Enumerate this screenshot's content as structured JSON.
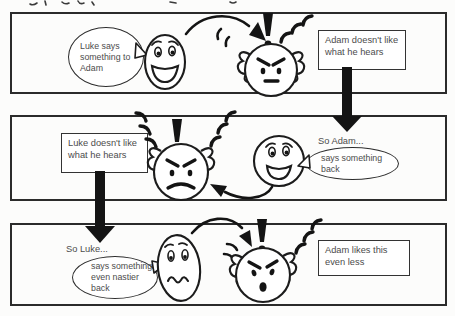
{
  "panel1": {
    "bubble": "Luke says something to Adam",
    "box": "Adam doesn't like what he hears"
  },
  "panel2": {
    "box": "Luke doesn't like what he hears",
    "caption": "So Adam...",
    "bubble": "says something back"
  },
  "panel3": {
    "caption": "So Luke...",
    "bubble": "says something even nastier back",
    "box": "Adam likes this even less"
  },
  "icons": {
    "happy_face": "smiling-speaker-face",
    "angry_face": "angry-listener-face",
    "worried_face": "worried-speaker-face",
    "exclamation": "exclamation-mark",
    "vibration": "vibration-marks",
    "speech_arrow": "curved-speech-arrow",
    "consequence_arrow": "thick-down-arrow"
  },
  "colors": {
    "ink": "#1c1c1c",
    "text": "#4c4c4c",
    "paper": "#fcfcfb",
    "panel_border": "#2b2b2b"
  }
}
